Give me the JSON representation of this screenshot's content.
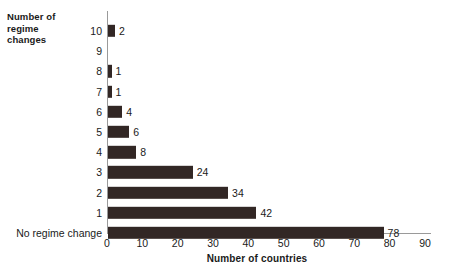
{
  "chart_data": {
    "type": "bar",
    "orientation": "horizontal",
    "title": "",
    "xlabel": "Number of countries",
    "ylabel": "Number of\nregime\nchanges",
    "categories": [
      "No regime change",
      "1",
      "2",
      "3",
      "4",
      "5",
      "6",
      "7",
      "8",
      "9",
      "10"
    ],
    "values": [
      78,
      42,
      34,
      24,
      8,
      6,
      4,
      1,
      1,
      0,
      2
    ],
    "value_labels": [
      "78",
      "42",
      "34",
      "24",
      "8",
      "6",
      "4",
      "1",
      "1",
      "",
      "2"
    ],
    "xlim": [
      0,
      90
    ],
    "xticks": [
      0,
      10,
      20,
      30,
      40,
      50,
      60,
      70,
      80,
      90
    ],
    "xtick_labels": [
      "0",
      "10",
      "20",
      "30",
      "40",
      "50",
      "60",
      "70",
      "80",
      "90"
    ],
    "grid": false,
    "legend": false,
    "bar_color": "#322725",
    "axis_color": "#9a9a9a",
    "background": "#ffffff"
  },
  "rows": [
    {
      "category": "10",
      "value": 2,
      "label": "2"
    },
    {
      "category": "9",
      "value": 0,
      "label": ""
    },
    {
      "category": "8",
      "value": 1,
      "label": "1"
    },
    {
      "category": "7",
      "value": 1,
      "label": "1"
    },
    {
      "category": "6",
      "value": 4,
      "label": "4"
    },
    {
      "category": "5",
      "value": 6,
      "label": "6"
    },
    {
      "category": "4",
      "value": 8,
      "label": "8"
    },
    {
      "category": "3",
      "value": 24,
      "label": "24"
    },
    {
      "category": "2",
      "value": 34,
      "label": "34"
    },
    {
      "category": "1",
      "value": 42,
      "label": "42"
    },
    {
      "category": "No regime change",
      "value": 78,
      "label": "78"
    }
  ],
  "axes": {
    "y_title": "Number of\nregime\nchanges",
    "x_title": "Number of countries",
    "x_ticks": [
      "0",
      "10",
      "20",
      "30",
      "40",
      "50",
      "60",
      "70",
      "80",
      "90"
    ]
  }
}
